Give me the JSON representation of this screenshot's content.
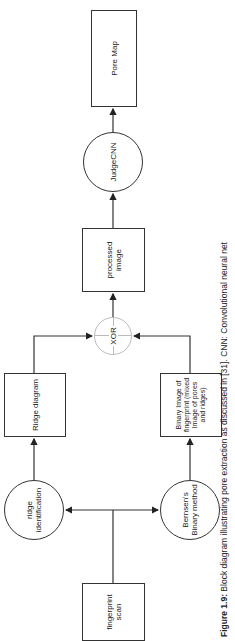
{
  "diagram": {
    "type": "block-diagram",
    "orientation": "rotated-90-ccw",
    "nodes": {
      "fingerprint_scan": "fingerprint scan",
      "ridge_identification": "ridge identification",
      "bernsen_binary": "Bernsen's Binary method",
      "ridge_diagram": "Ridge diagram",
      "binary_image": "Binary Image of fingerprint (mixed Image of pores and ridges)",
      "xor": "XOR",
      "processed_image": "processed image",
      "judgecnn": "JudgeCNN",
      "pore_map": "Pore Map"
    },
    "edges": [
      {
        "from": "fingerprint_scan",
        "to": "ridge_identification"
      },
      {
        "from": "fingerprint_scan",
        "to": "bernsen_binary"
      },
      {
        "from": "ridge_identification",
        "to": "ridge_diagram"
      },
      {
        "from": "bernsen_binary",
        "to": "binary_image"
      },
      {
        "from": "ridge_diagram",
        "to": "xor"
      },
      {
        "from": "binary_image",
        "to": "xor"
      },
      {
        "from": "xor",
        "to": "processed_image"
      },
      {
        "from": "processed_image",
        "to": "judgecnn"
      },
      {
        "from": "judgecnn",
        "to": "pore_map"
      }
    ]
  },
  "caption": {
    "label": "Figure 1.9:",
    "text": " Block diagram illustrating pore extraction as discussed in [31]. CNN: Convolutional neural net"
  }
}
